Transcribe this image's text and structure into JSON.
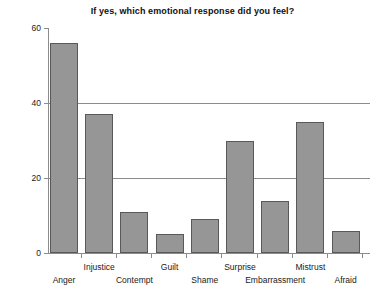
{
  "chart_data": {
    "type": "bar",
    "title": "If yes, which emotional response did you feel?",
    "xlabel": "",
    "ylabel": "",
    "categories": [
      "Anger",
      "Injustice",
      "Contempt",
      "Guilt",
      "Shame",
      "Surprise",
      "Embarrassment",
      "Mistrust",
      "Afraid"
    ],
    "values": [
      56,
      37,
      11,
      5,
      9,
      30,
      14,
      35,
      6
    ],
    "ylim": [
      0,
      60
    ],
    "yticks": [
      0,
      20,
      40,
      60
    ],
    "ytick_labels": [
      "0",
      "20",
      "40",
      "60"
    ],
    "grid": true,
    "legend": "none",
    "bar_fill_color": "#969696",
    "bar_edge_color": "#595959",
    "axis_color": "#8c8c8c",
    "background_color": "#ffffff",
    "label_rows": [
      1,
      0,
      1,
      0,
      1,
      0,
      1,
      0,
      1
    ]
  }
}
